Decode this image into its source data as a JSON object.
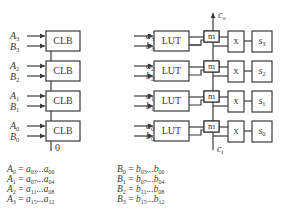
{
  "diagram": {
    "left": {
      "block_label": "CLB",
      "stages": [
        {
          "a": "A",
          "a_sub": "3",
          "b": "B",
          "b_sub": "3"
        },
        {
          "a": "A",
          "a_sub": "2",
          "b": "B",
          "b_sub": "2"
        },
        {
          "a": "A",
          "a_sub": "1",
          "b": "B",
          "b_sub": "1"
        },
        {
          "a": "A",
          "a_sub": "0",
          "b": "B",
          "b_sub": "0"
        }
      ],
      "carry_in_label": "0"
    },
    "right": {
      "lut_label": "LUT",
      "mux_label": "m",
      "xor_label": "x",
      "carry_out": {
        "c": "c",
        "sub": "o"
      },
      "carry_in": {
        "c": "c",
        "sub": "i"
      },
      "stages": [
        {
          "a": "a",
          "a_sub": "3",
          "b": "b",
          "b_sub": "3",
          "s": "s",
          "s_sub": "3"
        },
        {
          "a": "a",
          "a_sub": "2",
          "b": "b",
          "b_sub": "2",
          "s": "s",
          "s_sub": "2"
        },
        {
          "a": "a",
          "a_sub": "1",
          "b": "b",
          "b_sub": "1",
          "s": "s",
          "s_sub": "1"
        },
        {
          "a": "a",
          "a_sub": "0",
          "b": "b",
          "b_sub": "0",
          "s": "s",
          "s_sub": "0"
        }
      ]
    },
    "equations": {
      "left": [
        {
          "lhs": "A",
          "lhs_sub": "0",
          "v": "a",
          "hi": "03",
          "lo": "00"
        },
        {
          "lhs": "A",
          "lhs_sub": "1",
          "v": "a",
          "hi": "07",
          "lo": "04"
        },
        {
          "lhs": "A",
          "lhs_sub": "2",
          "v": "a",
          "hi": "11",
          "lo": "08"
        },
        {
          "lhs": "A",
          "lhs_sub": "3",
          "v": "a",
          "hi": "15",
          "lo": "12"
        }
      ],
      "right": [
        {
          "lhs": "B",
          "lhs_sub": "0",
          "v": "b",
          "hi": "03",
          "lo": "00"
        },
        {
          "lhs": "B",
          "lhs_sub": "1",
          "v": "b",
          "hi": "07",
          "lo": "04"
        },
        {
          "lhs": "B",
          "lhs_sub": "2",
          "v": "b",
          "hi": "11",
          "lo": "08"
        },
        {
          "lhs": "B",
          "lhs_sub": "3",
          "v": "b",
          "hi": "15",
          "lo": "12"
        }
      ],
      "eq_sign": " = ",
      "ellipsis": "..."
    }
  }
}
